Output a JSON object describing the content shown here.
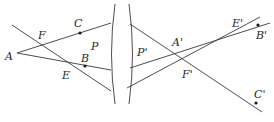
{
  "diagram": {
    "type": "ray-optics-thin-lens",
    "colors": {
      "line": "#3a3a3a",
      "text": "#2a2a2a",
      "background": "#ffffff"
    },
    "lens": {
      "label": ""
    },
    "labels": {
      "A": "A",
      "B": "B",
      "C": "C",
      "E": "E",
      "F": "F",
      "P": "P",
      "P_prime": "P'",
      "A_prime": "A'",
      "B_prime": "B'",
      "C_prime": "C'",
      "E_prime": "E'",
      "F_prime": "F'"
    },
    "points": [
      {
        "name": "A",
        "x": 17,
        "y": 53
      },
      {
        "name": "B",
        "x": 85,
        "y": 66
      },
      {
        "name": "C",
        "x": 80,
        "y": 33
      },
      {
        "name": "E",
        "x": 68,
        "y": 62
      },
      {
        "name": "F",
        "x": 41,
        "y": 45
      },
      {
        "name": "A'",
        "x": 175,
        "y": 52
      },
      {
        "name": "B'",
        "x": 258,
        "y": 25
      },
      {
        "name": "C'",
        "x": 256,
        "y": 103
      },
      {
        "name": "E'",
        "x": 234,
        "y": 28
      },
      {
        "name": "F'",
        "x": 187,
        "y": 63
      }
    ]
  }
}
